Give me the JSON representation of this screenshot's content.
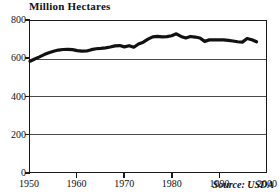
{
  "chart_data": {
    "type": "line",
    "title": "Million Hectares",
    "xlabel": "",
    "ylabel": "",
    "ylim": [
      0,
      800
    ],
    "xlim": [
      1950,
      2000
    ],
    "grid": true,
    "legend": null,
    "source_note": "Source: USDA",
    "yticks": [
      0,
      200,
      400,
      600,
      800
    ],
    "ytick_labels": [
      "0",
      "200",
      "400",
      "600",
      "800"
    ],
    "xticks": [
      1950,
      1960,
      1970,
      1980,
      1990,
      2000
    ],
    "xtick_labels": [
      "1950",
      "1960",
      "1970",
      "1980",
      "1990",
      "2000"
    ],
    "series": [
      {
        "name": "World Grain Harvested Area",
        "color": "#111111",
        "x": [
          1950,
          1951,
          1952,
          1953,
          1954,
          1955,
          1956,
          1957,
          1958,
          1959,
          1960,
          1961,
          1962,
          1963,
          1964,
          1965,
          1966,
          1967,
          1968,
          1969,
          1970,
          1971,
          1972,
          1973,
          1974,
          1975,
          1976,
          1977,
          1978,
          1979,
          1980,
          1981,
          1982,
          1983,
          1984,
          1985,
          1986,
          1987,
          1988,
          1989,
          1990,
          1991,
          1992,
          1993,
          1994,
          1995,
          1996,
          1997,
          1998
        ],
        "values": [
          587,
          599,
          610,
          622,
          632,
          640,
          646,
          649,
          650,
          648,
          643,
          640,
          641,
          648,
          653,
          655,
          658,
          662,
          668,
          670,
          663,
          669,
          661,
          678,
          688,
          704,
          716,
          719,
          716,
          717,
          722,
          732,
          718,
          710,
          718,
          715,
          710,
          692,
          700,
          700,
          700,
          700,
          697,
          694,
          690,
          688,
          707,
          701,
          690
        ]
      }
    ]
  }
}
